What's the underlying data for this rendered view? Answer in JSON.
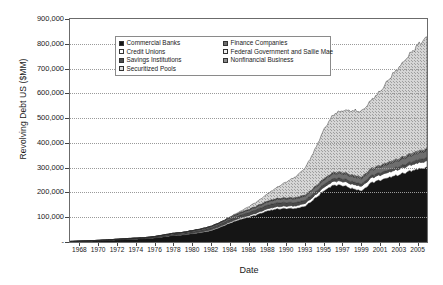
{
  "chart_data": {
    "type": "area",
    "stacked": true,
    "title": "",
    "xlabel": "Date",
    "ylabel": "Revolving Debt US ($MM)",
    "ylim": [
      0,
      900000
    ],
    "ytick_labels": [
      "900,000",
      "800,000",
      "700,000",
      "600,000",
      "500,000",
      "400,000",
      "300,000",
      "200,000",
      "100,000",
      "-"
    ],
    "ytick_values": [
      900000,
      800000,
      700000,
      600000,
      500000,
      400000,
      300000,
      200000,
      100000,
      0
    ],
    "grid": true,
    "legend_position": "inside-top-center",
    "xtick_labels": [
      "1968",
      "1970",
      "1972",
      "1974",
      "1976",
      "1978",
      "1980",
      "1982",
      "1984",
      "1986",
      "1988",
      "1990",
      "1993",
      "1995",
      "1997",
      "1999",
      "2001",
      "2003",
      "2005"
    ],
    "x_start": 1968,
    "x_end": 2005.9,
    "series": [
      {
        "name": "Commercial Banks",
        "pattern": "solid-black",
        "color": "#151515",
        "x": [
          1968,
          1970,
          1972,
          1974,
          1976,
          1977,
          1978,
          1979,
          1980,
          1981,
          1982,
          1983,
          1984,
          1985,
          1986,
          1987,
          1988,
          1989,
          1990,
          1991,
          1992,
          1993,
          1994,
          1995,
          1996,
          1997,
          1998,
          1999,
          2000,
          2001,
          2002,
          2003,
          2004,
          2005,
          2005.9
        ],
        "values": [
          1500,
          3000,
          6000,
          10000,
          13000,
          16000,
          21000,
          26000,
          28000,
          33000,
          38000,
          46000,
          60000,
          76000,
          90000,
          100000,
          112000,
          126000,
          133000,
          135000,
          135000,
          145000,
          175000,
          208000,
          230000,
          228000,
          215000,
          206000,
          240000,
          250000,
          262000,
          272000,
          285000,
          295000,
          300000
        ]
      },
      {
        "name": "Credit Unions",
        "pattern": "white",
        "color": "#ffffff",
        "x": [
          1968,
          1976,
          1980,
          1984,
          1988,
          1990,
          1992,
          1994,
          1996,
          1998,
          2000,
          2002,
          2004,
          2005.9
        ],
        "values": [
          200,
          800,
          2000,
          4000,
          8000,
          10000,
          11000,
          13000,
          16000,
          18000,
          20000,
          22000,
          24000,
          26000
        ]
      },
      {
        "name": "Savings Institutions",
        "pattern": "dark-gray",
        "color": "#4a4a4a",
        "x": [
          1968,
          1976,
          1980,
          1984,
          1988,
          1990,
          1992,
          1994,
          1996,
          1998,
          2000,
          2002,
          2004,
          2005.9
        ],
        "values": [
          300,
          2000,
          5000,
          9000,
          14000,
          15000,
          13000,
          12000,
          11000,
          10000,
          9000,
          9000,
          11000,
          13000
        ]
      },
      {
        "name": "Securitized Pools",
        "pattern": "light-hatch",
        "color": "#c9c9c9",
        "x": [
          1968,
          1984,
          1986,
          1988,
          1989,
          1990,
          1991,
          1992,
          1993,
          1994,
          1995,
          1996,
          1997,
          1998,
          1999,
          2000,
          2001,
          2002,
          2003,
          2004,
          2005,
          2005.9
        ],
        "values": [
          0,
          0,
          4000,
          18000,
          30000,
          45000,
          65000,
          85000,
          110000,
          150000,
          200000,
          235000,
          250000,
          260000,
          265000,
          275000,
          300000,
          340000,
          370000,
          400000,
          430000,
          450000
        ]
      },
      {
        "name": "Finance Companies",
        "pattern": "mid-gray",
        "color": "#6e6e6e",
        "x": [
          1968,
          1976,
          1984,
          1990,
          1995,
          2000,
          2005.9
        ],
        "values": [
          200,
          1500,
          5000,
          14000,
          18000,
          22000,
          28000
        ]
      },
      {
        "name": "Federal Government and Sallie Mae",
        "pattern": "white-dots",
        "color": "#e8e8e8",
        "x": [
          1968,
          1980,
          1990,
          2000,
          2005.9
        ],
        "values": [
          0,
          0,
          1000,
          2000,
          3000
        ]
      },
      {
        "name": "Nonfinancial Business",
        "pattern": "checker-gray",
        "color": "#8c8c8c",
        "x": [
          1968,
          1980,
          1990,
          1995,
          2000,
          2005.9
        ],
        "values": [
          100,
          800,
          3000,
          4000,
          5000,
          6000
        ]
      }
    ],
    "total_peak": 840000
  },
  "legend": {
    "items": [
      {
        "label": "Commercial Banks",
        "swatch": "solid-black"
      },
      {
        "label": "Finance Companies",
        "swatch": "mid-gray"
      },
      {
        "label": "Credit Unions",
        "swatch": "white"
      },
      {
        "label": "Federal Government and Sallie Mae",
        "swatch": "white-dots"
      },
      {
        "label": "Savings Institutions",
        "swatch": "dark-gray"
      },
      {
        "label": "Nonfinancial Business",
        "swatch": "checker-gray"
      },
      {
        "label": "Securitized Pools",
        "swatch": "light-hatch"
      }
    ]
  }
}
